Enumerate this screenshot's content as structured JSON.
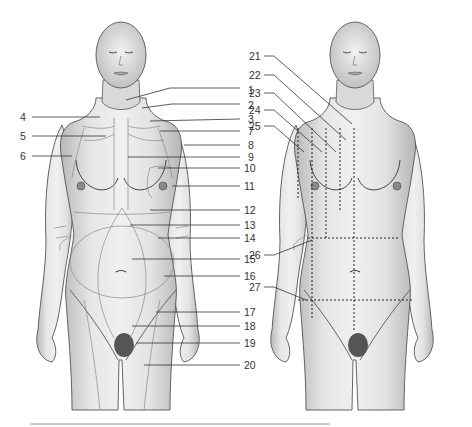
{
  "figure": {
    "left_panel": {
      "name": "anterior regions of trunk and neck",
      "labels": [
        {
          "n": "1",
          "x": 248,
          "y": 90
        },
        {
          "n": "2",
          "x": 248,
          "y": 106
        },
        {
          "n": "3",
          "x": 248,
          "y": 121
        },
        {
          "n": "4",
          "x": 22,
          "y": 118
        },
        {
          "n": "5",
          "x": 22,
          "y": 137
        },
        {
          "n": "6",
          "x": 22,
          "y": 157
        },
        {
          "n": "7",
          "x": 248,
          "y": 134
        },
        {
          "n": "8",
          "x": 248,
          "y": 147
        },
        {
          "n": "9",
          "x": 248,
          "y": 159
        },
        {
          "n": "10",
          "x": 244,
          "y": 170
        },
        {
          "n": "11",
          "x": 244,
          "y": 188
        },
        {
          "n": "12",
          "x": 244,
          "y": 212
        },
        {
          "n": "13",
          "x": 244,
          "y": 227
        },
        {
          "n": "14",
          "x": 244,
          "y": 240
        },
        {
          "n": "15",
          "x": 244,
          "y": 261
        },
        {
          "n": "16",
          "x": 244,
          "y": 278
        },
        {
          "n": "17",
          "x": 244,
          "y": 314
        },
        {
          "n": "18",
          "x": 244,
          "y": 328
        },
        {
          "n": "19",
          "x": 244,
          "y": 345
        },
        {
          "n": "20",
          "x": 244,
          "y": 367
        }
      ]
    },
    "right_panel": {
      "name": "orientation lines of trunk",
      "labels": [
        {
          "n": "21",
          "x": 250,
          "y": 59
        },
        {
          "n": "22",
          "x": 250,
          "y": 79
        },
        {
          "n": "23",
          "x": 250,
          "y": 96
        },
        {
          "n": "24",
          "x": 250,
          "y": 113
        },
        {
          "n": "25",
          "x": 250,
          "y": 130
        },
        {
          "n": "26",
          "x": 250,
          "y": 259
        },
        {
          "n": "27",
          "x": 250,
          "y": 290
        }
      ]
    },
    "caption": ""
  },
  "colors": {
    "background": "#ffffff",
    "skin_light": "#ededed",
    "skin_shade": "#bdbdbd",
    "line": "#333333"
  }
}
